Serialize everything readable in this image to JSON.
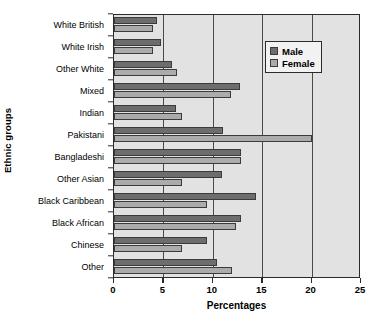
{
  "chart_data": {
    "type": "bar",
    "orientation": "horizontal",
    "title": "",
    "xlabel": "Percentages",
    "ylabel": "Ethnic groups",
    "xlim": [
      0,
      25
    ],
    "xticks": [
      0,
      5,
      10,
      15,
      20,
      25
    ],
    "xtick_labels": [
      "0",
      "5",
      "10",
      "15",
      "20",
      "25"
    ],
    "grid": "vertical",
    "legend_position": "top-right",
    "categories": [
      "White British",
      "White Irish",
      "Other White",
      "Mixed",
      "Indian",
      "Pakistani",
      "Bangladeshi",
      "Other Asian",
      "Black Caribbean",
      "Black African",
      "Chinese",
      "Other"
    ],
    "series": [
      {
        "name": "Male",
        "color": "#6d6d6d",
        "values": [
          4.4,
          4.8,
          5.9,
          12.8,
          6.3,
          11.0,
          12.9,
          10.9,
          14.4,
          12.9,
          9.4,
          10.4
        ]
      },
      {
        "name": "Female",
        "color": "#ababab",
        "values": [
          3.9,
          3.9,
          6.4,
          11.8,
          6.9,
          20.0,
          12.9,
          6.9,
          9.4,
          12.3,
          6.9,
          11.9
        ]
      }
    ]
  },
  "legend": {
    "entries": [
      {
        "label": "Male",
        "swatch": "male"
      },
      {
        "label": "Female",
        "swatch": "female"
      }
    ]
  },
  "colors": {
    "male_bar": "#6d6d6d",
    "female_bar": "#ababab",
    "plot_background": "#e2e2e2",
    "axis": "#2b2b2b",
    "gridline": "#4a4a4a"
  }
}
